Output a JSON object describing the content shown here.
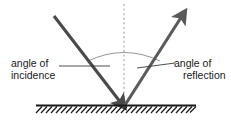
{
  "diagram": {
    "background_color": "#ffffff",
    "ray_color": "#4a4a4a",
    "normal_color": "#9a9a9a",
    "arc_color": "#8a8a8a",
    "surface_color": "#1a1a1a",
    "leader_color": "#3a3a3a",
    "text_color": "#1a1a1a",
    "labels": {
      "incidence": {
        "line1": "angle of",
        "line2": "incidence"
      },
      "reflection": {
        "line1": "angle of",
        "line2": "reflection"
      }
    },
    "elements": {
      "incident_ray_name": "incident ray",
      "reflected_ray_name": "reflected ray",
      "normal_name": "normal",
      "surface_name": "mirror surface",
      "arc_name": "angle arc"
    }
  }
}
